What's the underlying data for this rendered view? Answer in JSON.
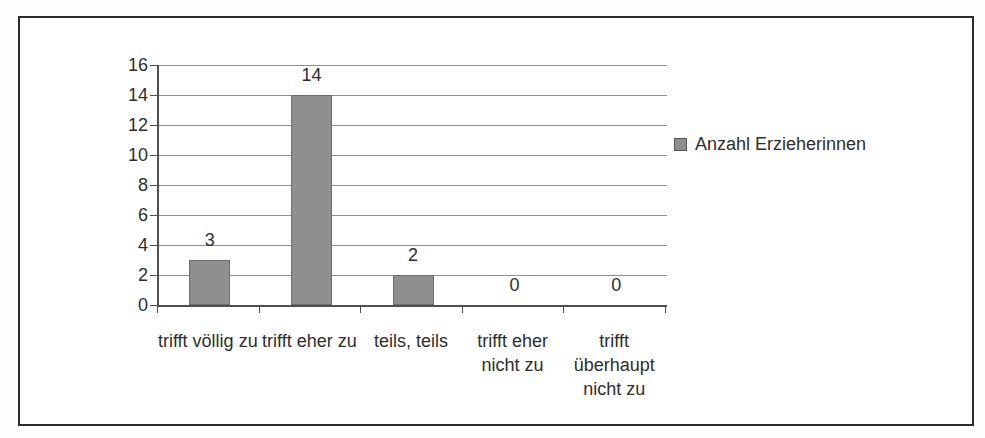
{
  "chart_data": {
    "type": "bar",
    "title": "",
    "xlabel": "",
    "ylabel": "",
    "categories": [
      "trifft völlig zu",
      "trifft eher zu",
      "teils, teils",
      "trifft eher nicht zu",
      "trifft überhaupt nicht zu"
    ],
    "values": [
      3,
      14,
      2,
      0,
      0
    ],
    "data_labels": [
      "3",
      "14",
      "2",
      "0",
      "0"
    ],
    "series": [
      {
        "name": "Anzahl Erzieherinnen",
        "values": [
          3,
          14,
          2,
          0,
          0
        ]
      }
    ],
    "legend": {
      "entries": [
        "Anzahl Erzieherinnen"
      ],
      "position": "right"
    },
    "ylim": [
      0,
      16
    ],
    "yticks": [
      0,
      2,
      4,
      6,
      8,
      10,
      12,
      14,
      16
    ],
    "grid": true,
    "colors": {
      "bar_fill": "#8f8f8f",
      "bar_border": "#6e6e6e",
      "gridline": "#8f8f8f",
      "axis": "#4f4f4f",
      "text": "#2e2e2e",
      "frame_border": "#2b2b2b"
    }
  }
}
